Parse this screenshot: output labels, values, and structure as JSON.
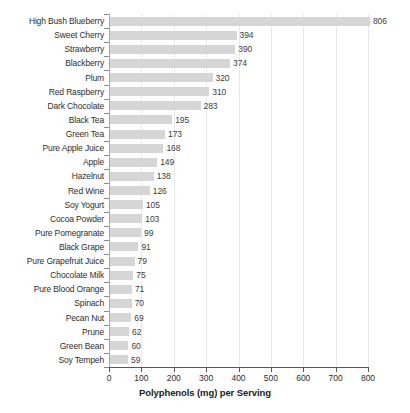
{
  "chart_data": {
    "type": "bar",
    "orientation": "horizontal",
    "title": "",
    "xlabel": "Polyphenols (mg) per Serving",
    "ylabel": "",
    "xlim": [
      0,
      800
    ],
    "xticks": [
      0,
      100,
      200,
      300,
      400,
      500,
      600,
      700,
      800
    ],
    "xtick_labels": [
      "0",
      "100",
      "200",
      "300",
      "400",
      "500",
      "600",
      "700",
      "800"
    ],
    "grid": "vertical",
    "legend": "none",
    "bar_color": "#d6d6d6",
    "categories": [
      "High Bush Blueberry",
      "Sweet Cherry",
      "Strawberry",
      "Blackberry",
      "Plum",
      "Red Raspberry",
      "Dark Chocolate",
      "Black Tea",
      "Green Tea",
      "Pure Apple Juice",
      "Apple",
      "Hazelnut",
      "Red Wine",
      "Soy Yogurt",
      "Cocoa Powder",
      "Pure Pomegranate",
      "Black Grape",
      "Pure Grapefruit Juice",
      "Chocolate Milk",
      "Pure Blood Orange",
      "Spinach",
      "Pecan Nut",
      "Prune",
      "Green Bean",
      "Soy Tempeh"
    ],
    "values": [
      806,
      394,
      390,
      374,
      320,
      310,
      283,
      195,
      173,
      168,
      149,
      138,
      126,
      105,
      103,
      99,
      91,
      79,
      75,
      71,
      70,
      69,
      62,
      60,
      59
    ],
    "value_labels": [
      "806",
      "394",
      "390",
      "374",
      "320",
      "310",
      "283",
      "195",
      "173",
      "168",
      "149",
      "138",
      "126",
      "105",
      "103",
      "99",
      "91",
      "79",
      "75",
      "71",
      "70",
      "69",
      "62",
      "60",
      "59"
    ]
  }
}
